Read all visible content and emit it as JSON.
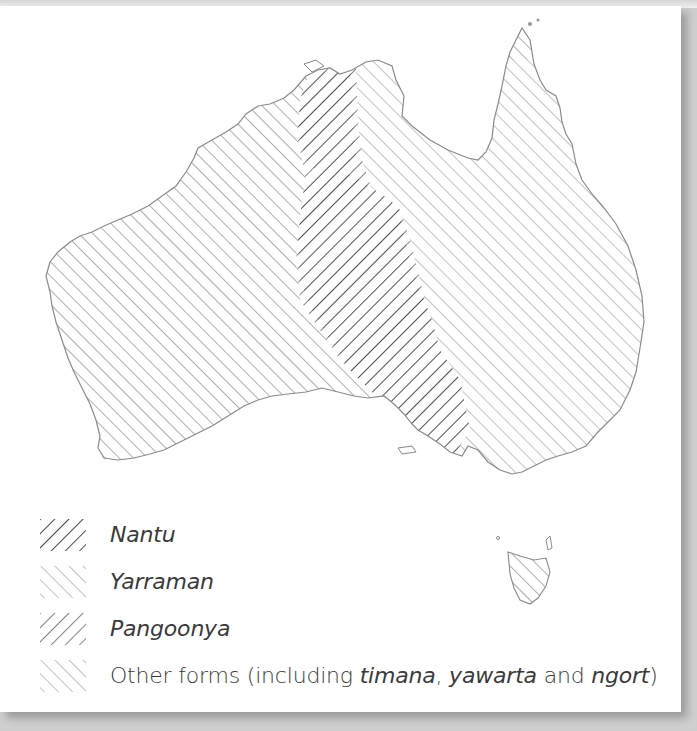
{
  "map": {
    "region": "Australia",
    "areas": [
      {
        "id": "nantu",
        "label": "Nantu",
        "pattern": "hatch-backslash-dark"
      },
      {
        "id": "yarraman",
        "label": "Yarraman",
        "pattern": "hatch-slash-light"
      },
      {
        "id": "pangoonya",
        "label": "Pangoonya",
        "pattern": "hatch-backslash-medium"
      },
      {
        "id": "other",
        "label": "Other forms",
        "pattern": "hatch-slash-medium"
      }
    ],
    "colors": {
      "background": "#ffffff",
      "coastline": "#8a8a8a",
      "nantu_hatch": "#555555",
      "pangoonya_hatch": "#777777",
      "yarraman_hatch": "#b0b0b0",
      "other_hatch": "#9a9a9a"
    }
  },
  "legend": {
    "items": [
      {
        "label": "Nantu",
        "italic": true
      },
      {
        "label": "Yarraman",
        "italic": true
      },
      {
        "label": "Pangoonya",
        "italic": true
      },
      {
        "label_prefix": "Other forms (including ",
        "term1": "timana",
        "sep1": ", ",
        "term2": "yawarta",
        "sep2": " and ",
        "term3": "ngort",
        "suffix": ")"
      }
    ]
  }
}
